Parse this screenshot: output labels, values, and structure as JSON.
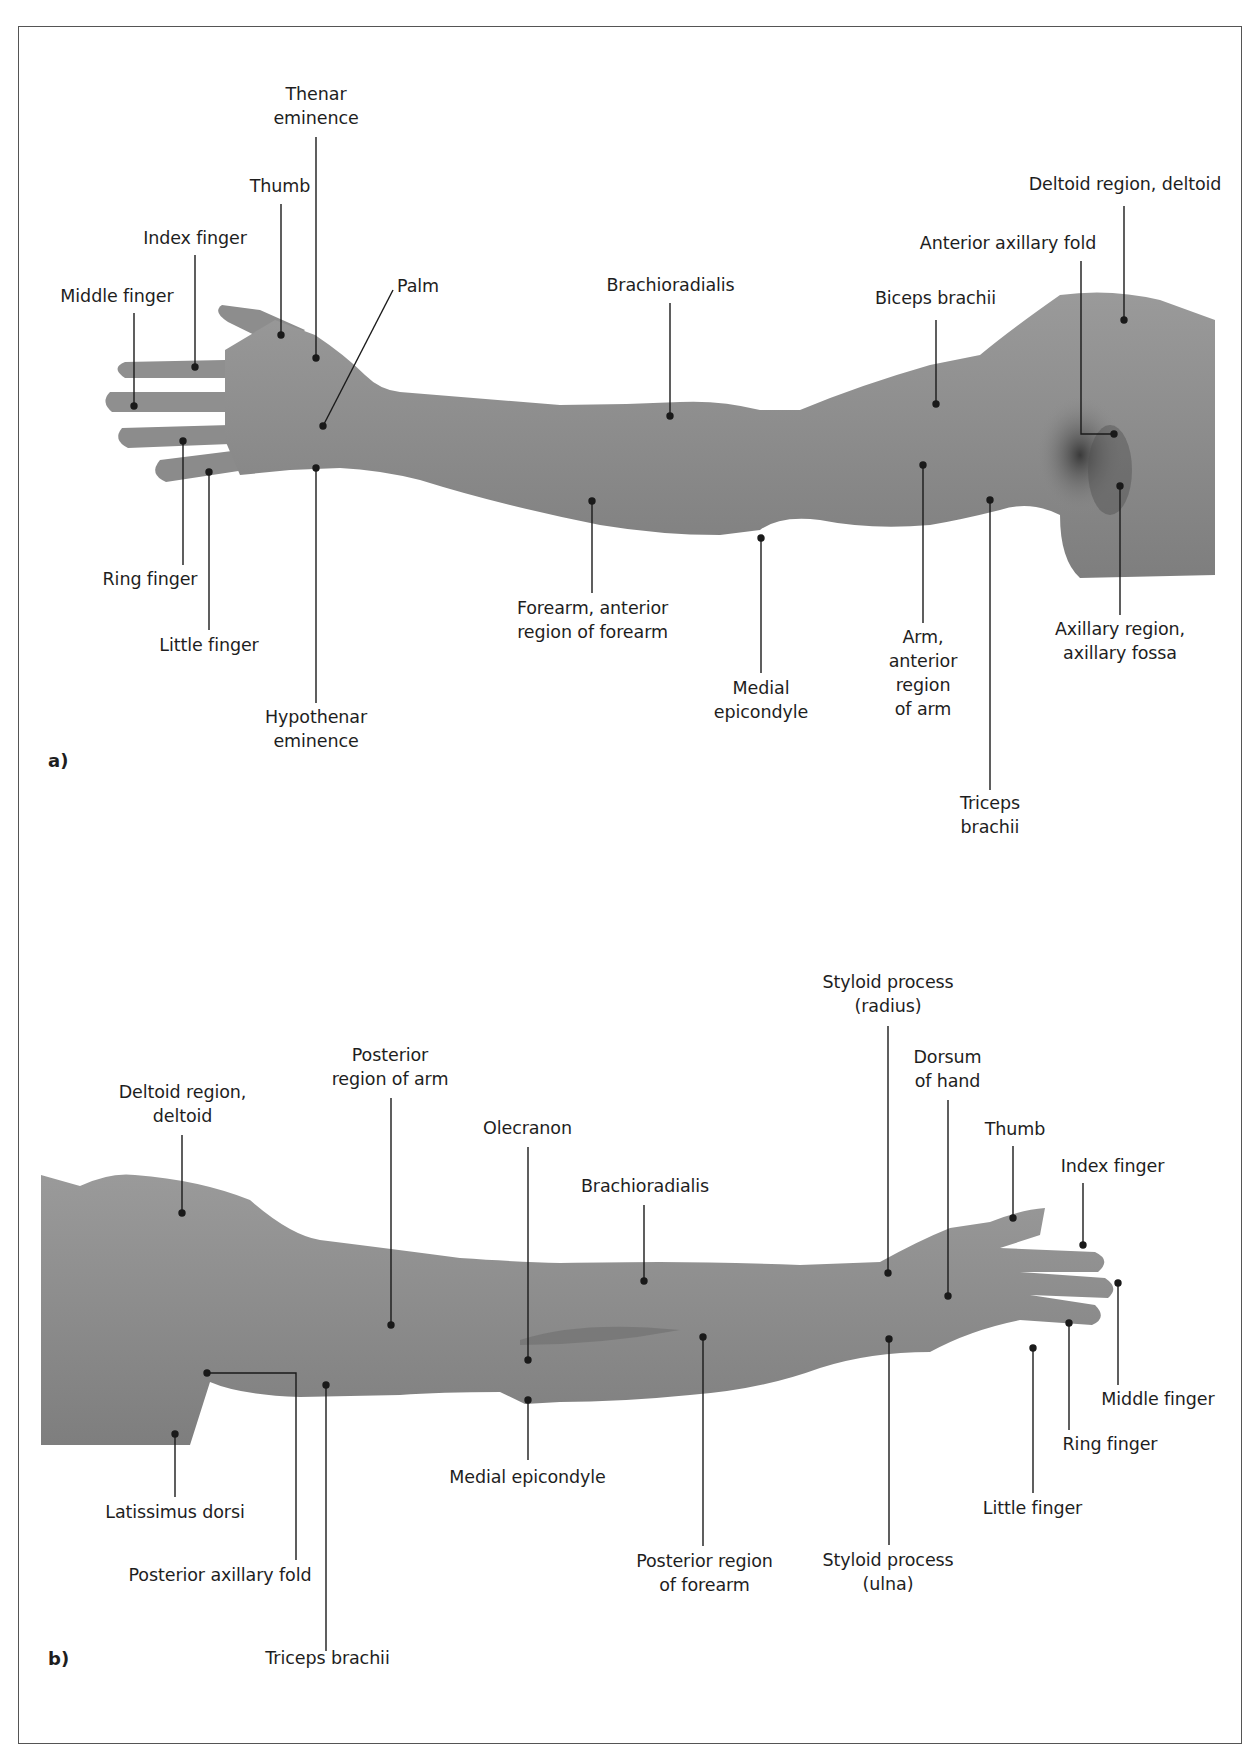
{
  "figure": {
    "panels": [
      {
        "tag": "a)",
        "view": "anterior view of right upper limb",
        "labels": {
          "thenar_eminence": [
            "Thenar",
            "eminence"
          ],
          "thumb": "Thumb",
          "index_finger": "Index finger",
          "middle_finger": "Middle finger",
          "palm": "Palm",
          "ring_finger": "Ring finger",
          "little_finger": "Little finger",
          "hypothenar_eminence": [
            "Hypothenar",
            "eminence"
          ],
          "brachioradialis": "Brachioradialis",
          "forearm_anterior": [
            "Forearm, anterior",
            "region of forearm"
          ],
          "medial_epicondyle": [
            "Medial",
            "epicondyle"
          ],
          "biceps_brachii": "Biceps brachii",
          "anterior_axillary_fold": "Anterior axillary fold",
          "deltoid": "Deltoid region, deltoid",
          "arm_anterior": [
            "Arm,",
            "anterior",
            "region",
            "of arm"
          ],
          "triceps_brachii": [
            "Triceps",
            "brachii"
          ],
          "axillary_region": [
            "Axillary region,",
            "axillary fossa"
          ]
        }
      },
      {
        "tag": "b)",
        "view": "posterior view of left upper limb",
        "labels": {
          "deltoid": [
            "Deltoid region,",
            "deltoid"
          ],
          "posterior_arm": [
            "Posterior",
            "region of arm"
          ],
          "olecranon": "Olecranon",
          "brachioradialis": "Brachioradialis",
          "styloid_radius": [
            "Styloid process",
            "(radius)"
          ],
          "dorsum_hand": [
            "Dorsum",
            "of hand"
          ],
          "thumb": "Thumb",
          "index_finger": "Index finger",
          "middle_finger": "Middle finger",
          "ring_finger": "Ring finger",
          "little_finger": "Little finger",
          "styloid_ulna": [
            "Styloid process",
            "(ulna)"
          ],
          "posterior_forearm": [
            "Posterior region",
            "of forearm"
          ],
          "medial_epicondyle": "Medial epicondyle",
          "latissimus_dorsi": "Latissimus dorsi",
          "posterior_axillary_fold": "Posterior axillary fold",
          "triceps_brachii": "Triceps brachii"
        }
      }
    ],
    "colors": {
      "skin": "#8e8e8e",
      "skin_dark": "#6f6f6f",
      "axilla_shadow": "#3e3e3e",
      "leader": "#1a1a1a",
      "frame": "#555555"
    }
  }
}
